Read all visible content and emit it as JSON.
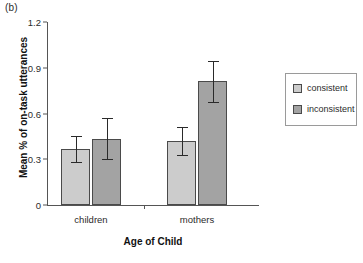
{
  "panel": {
    "label": "(b)"
  },
  "chart_data": {
    "type": "bar",
    "title": "",
    "subtitle": "",
    "xlabel": "Age of Child",
    "ylabel": "Mean % of on-task utterances",
    "categories": [
      "children",
      "mothers"
    ],
    "ylim": [
      0,
      1.2
    ],
    "yticks": [
      "0",
      "0.3",
      "0.6",
      "0.9",
      "1.2"
    ],
    "ytick_values": [
      0,
      0.3,
      0.6,
      0.9,
      1.2
    ],
    "grid": false,
    "legend_position": "right",
    "series": [
      {
        "name": "consistent",
        "color": "#cccccc",
        "values": [
          0.37,
          0.42
        ],
        "errors": [
          0.085,
          0.09
        ],
        "error_upper": [
          0.455,
          0.51
        ],
        "error_lower": [
          0.285,
          0.33
        ]
      },
      {
        "name": "inconsistent",
        "color": "#a3a3a3",
        "values": [
          0.435,
          0.81
        ],
        "errors": [
          0.135,
          0.135
        ],
        "error_upper": [
          0.57,
          0.945
        ],
        "error_lower": [
          0.3,
          0.675
        ]
      }
    ]
  },
  "legend": {
    "items": [
      {
        "label": "consistent",
        "color": "#cccccc"
      },
      {
        "label": "inconsistent",
        "color": "#a3a3a3"
      }
    ]
  }
}
